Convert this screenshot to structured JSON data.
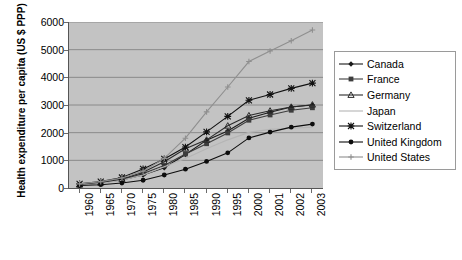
{
  "chart_data": {
    "type": "line",
    "title": "",
    "xlabel": "",
    "ylabel": "Health expenditure per capita (US $ PPP)",
    "categories": [
      "1960",
      "1965",
      "1970",
      "1975",
      "1980",
      "1985",
      "1990",
      "1995",
      "2000",
      "2001",
      "2002",
      "2003"
    ],
    "ylim": [
      0,
      6000
    ],
    "ytick_labels": [
      "0",
      "1000",
      "2000",
      "3000",
      "4000",
      "5000",
      "6000"
    ],
    "yticks": [
      0,
      1000,
      2000,
      3000,
      4000,
      5000,
      6000
    ],
    "grid": "horizontal",
    "legend_position": "right",
    "plot_background": "#c3c3c3",
    "series": [
      {
        "name": "Canada",
        "marker": "diamond",
        "color": "#1a1a1a",
        "values": [
          120,
          190,
          290,
          470,
          730,
          1210,
          1730,
          2060,
          2520,
          2740,
          2930,
          3000
        ]
      },
      {
        "name": "France",
        "marker": "square",
        "color": "#3d3d3d",
        "values": [
          110,
          180,
          310,
          520,
          810,
          1230,
          1600,
          1990,
          2450,
          2640,
          2810,
          2900
        ]
      },
      {
        "name": "Germany",
        "marker": "triangle",
        "color": "#2b2b2b",
        "values": [
          120,
          190,
          320,
          570,
          950,
          1420,
          1740,
          2250,
          2620,
          2790,
          2930,
          3010
        ]
      },
      {
        "name": "Japan",
        "marker": "none",
        "color": "#b5b5b5",
        "values": [
          100,
          160,
          280,
          470,
          770,
          1070,
          1420,
          1740,
          2010,
          2120,
          2160,
          2200
        ]
      },
      {
        "name": "Switzerland",
        "marker": "star",
        "color": "#111111",
        "values": [
          150,
          230,
          380,
          690,
          1050,
          1480,
          2030,
          2590,
          3170,
          3380,
          3600,
          3790
        ]
      },
      {
        "name": "United Kingdom",
        "marker": "circle",
        "color": "#0d0d0d",
        "values": [
          90,
          120,
          180,
          280,
          470,
          680,
          960,
          1270,
          1810,
          2020,
          2200,
          2310
        ]
      },
      {
        "name": "United States",
        "marker": "plus",
        "color": "#8f8f8f",
        "values": [
          150,
          230,
          360,
          610,
          1070,
          1800,
          2750,
          3650,
          4570,
          4950,
          5320,
          5710
        ]
      }
    ]
  }
}
